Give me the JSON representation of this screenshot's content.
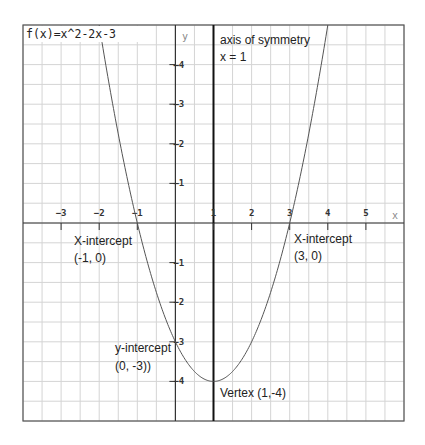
{
  "chart_data": {
    "type": "line",
    "title": "f(x)=x^2-2x-3",
    "xlabel": "x",
    "ylabel": "y",
    "xlim": [
      -4,
      6
    ],
    "ylim": [
      -5,
      5
    ],
    "grid": true,
    "grid_step": 0.5,
    "x_ticks": [
      -3,
      -2,
      -1,
      1,
      2,
      3,
      4,
      5
    ],
    "y_ticks": [
      4,
      3,
      2,
      1,
      -1,
      -2,
      -3,
      -4
    ],
    "series": [
      {
        "name": "f(x)=x^2-2x-3",
        "function": "x^2-2x-3",
        "x": [
          -2,
          -1.5,
          -1,
          -0.5,
          0,
          0.5,
          1,
          1.5,
          2,
          2.5,
          3,
          3.5,
          4
        ],
        "y": [
          5,
          2.25,
          0,
          -1.75,
          -3,
          -3.75,
          -4,
          -3.75,
          -3,
          -1.75,
          0,
          2.25,
          5
        ]
      }
    ],
    "axis_of_symmetry": {
      "x": 1,
      "label_line1": "axis of symmetry",
      "label_line2": "x = 1"
    },
    "annotations": [
      {
        "id": "x-intercept-left",
        "line1": "X-intercept",
        "line2": "(-1, 0)",
        "point": [
          -1,
          0
        ]
      },
      {
        "id": "x-intercept-right",
        "line1": "X-intercept",
        "line2": "(3, 0)",
        "point": [
          3,
          0
        ]
      },
      {
        "id": "y-intercept",
        "line1": "y-intercept",
        "line2": "(0, -3))",
        "point": [
          0,
          -3
        ]
      },
      {
        "id": "vertex",
        "line1": "Vertex (1,-4)",
        "point": [
          1,
          -4
        ]
      }
    ],
    "colors": {
      "grid": "#d4d4d4",
      "axis": "#333333",
      "curve": "#555555",
      "frame": "#555555"
    }
  }
}
